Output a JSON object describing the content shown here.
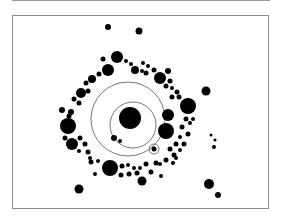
{
  "figure": {
    "colors": {
      "fill": "#000000",
      "line": "#555555",
      "frame": "#8c8c8c",
      "background": "#ffffff"
    },
    "center_body": {
      "cx": 130,
      "cy": 118,
      "r": 11
    },
    "orbits": [
      {
        "cx": 133,
        "cy": 125,
        "r": 23
      },
      {
        "cx": 128,
        "cy": 119,
        "r": 37
      },
      {
        "cx": 154,
        "cy": 149,
        "r": 5
      }
    ],
    "circles": [
      [
        108,
        27,
        3
      ],
      [
        139,
        31,
        3.5
      ],
      [
        117,
        57,
        6
      ],
      [
        103,
        59,
        2.5
      ],
      [
        108,
        70,
        6
      ],
      [
        99,
        74,
        2.5
      ],
      [
        92,
        79,
        4
      ],
      [
        86,
        83,
        2.5
      ],
      [
        81,
        93,
        5
      ],
      [
        88,
        91,
        2.5
      ],
      [
        79,
        103,
        2.5
      ],
      [
        74,
        99,
        2.5
      ],
      [
        71,
        112,
        3
      ],
      [
        62,
        110,
        3
      ],
      [
        69,
        116,
        2.5
      ],
      [
        68,
        126,
        8
      ],
      [
        65,
        138,
        2.5
      ],
      [
        72,
        144,
        6
      ],
      [
        80,
        138,
        2.5
      ],
      [
        85,
        144,
        2.5
      ],
      [
        79,
        151,
        2
      ],
      [
        88,
        152,
        2.5
      ],
      [
        90,
        158,
        2
      ],
      [
        98,
        161,
        2
      ],
      [
        91,
        162,
        2.5
      ],
      [
        95,
        174,
        2
      ],
      [
        110,
        168,
        8
      ],
      [
        121,
        175,
        2.5
      ],
      [
        122,
        166,
        2.5
      ],
      [
        129,
        174,
        2.5
      ],
      [
        128,
        165,
        2
      ],
      [
        134,
        168,
        2
      ],
      [
        137,
        173,
        2.5
      ],
      [
        142,
        181,
        4.5
      ],
      [
        140,
        168,
        2
      ],
      [
        146,
        164,
        2.5
      ],
      [
        151,
        172,
        2.5
      ],
      [
        156,
        163,
        2.5
      ],
      [
        161,
        176,
        2
      ],
      [
        160,
        164,
        2
      ],
      [
        166,
        160,
        2.5
      ],
      [
        173,
        163,
        2
      ],
      [
        174,
        155,
        2.5
      ],
      [
        126,
        61,
        2
      ],
      [
        131,
        64,
        2
      ],
      [
        135,
        70,
        4
      ],
      [
        143,
        63,
        2
      ],
      [
        148,
        66,
        2
      ],
      [
        146,
        73,
        2.5
      ],
      [
        142,
        71,
        2
      ],
      [
        154,
        70,
        2.5
      ],
      [
        160,
        78,
        6
      ],
      [
        168,
        71,
        3
      ],
      [
        170,
        81,
        2.5
      ],
      [
        166,
        86,
        2.5
      ],
      [
        172,
        88,
        2
      ],
      [
        177,
        92,
        2.5
      ],
      [
        172,
        97,
        2.5
      ],
      [
        179,
        97,
        2.5
      ],
      [
        188,
        106,
        8
      ],
      [
        168,
        115,
        6
      ],
      [
        166,
        131,
        8
      ],
      [
        186,
        119,
        2.5
      ],
      [
        193,
        119,
        2
      ],
      [
        182,
        127,
        2.5
      ],
      [
        190,
        123,
        2
      ],
      [
        188,
        134,
        2.5
      ],
      [
        180,
        137,
        2
      ],
      [
        184,
        144,
        2.5
      ],
      [
        176,
        144,
        2.5
      ],
      [
        170,
        149,
        2.5
      ],
      [
        180,
        150,
        2
      ],
      [
        176,
        158,
        2
      ],
      [
        114,
        138,
        3
      ],
      [
        120,
        141,
        2
      ],
      [
        206,
        91,
        4.5
      ],
      [
        211,
        135,
        1.5
      ],
      [
        215,
        140,
        1.5
      ],
      [
        214,
        147,
        2
      ],
      [
        209,
        184,
        5
      ],
      [
        218,
        195,
        3
      ],
      [
        79,
        189,
        4.5
      ]
    ],
    "small_orbit_body": {
      "cx": 154,
      "cy": 149,
      "r": 2.5
    }
  }
}
